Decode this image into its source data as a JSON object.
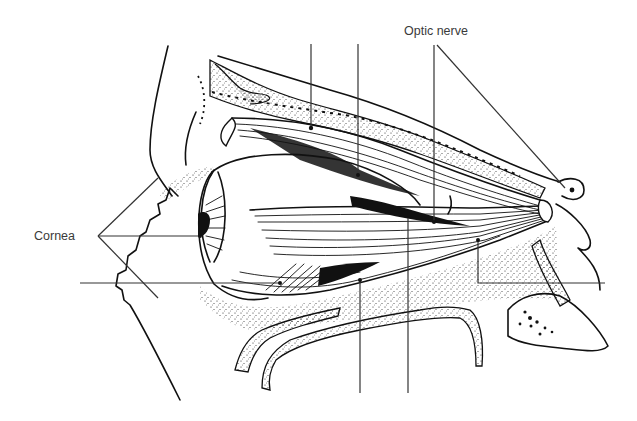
{
  "diagram": {
    "labels": {
      "optic_nerve": "Optic nerve",
      "cornea": "Cornea"
    },
    "unlabeled_leaders": [
      {
        "id": "top-1",
        "from": [
          311,
          44
        ],
        "to": [
          311,
          128
        ]
      },
      {
        "id": "top-2",
        "from": [
          358,
          44
        ],
        "to": [
          358,
          175
        ]
      },
      {
        "id": "bottom-1",
        "from": [
          360,
          393
        ],
        "to": [
          360,
          280
        ]
      },
      {
        "id": "bottom-2",
        "from": [
          408,
          393
        ],
        "to": [
          408,
          218
        ]
      },
      {
        "id": "left-1",
        "from": [
          80,
          283
        ],
        "to": [
          280,
          283
        ]
      },
      {
        "id": "right-1",
        "from": [
          605,
          283
        ],
        "to": [
          478,
          283
        ]
      }
    ],
    "colors": {
      "ink": "#111111",
      "label_text": "#3a3a3a",
      "background": "#ffffff"
    }
  }
}
